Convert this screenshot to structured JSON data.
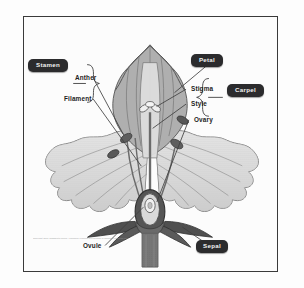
{
  "figure": {
    "credit": "Copyright 2001 Wadsworth Group / Thomson Learning is a division of Thomson Learning Inc."
  },
  "badges": [
    {
      "id": "stamen",
      "label": "Stamen"
    },
    {
      "id": "petal",
      "label": "Petal"
    },
    {
      "id": "carpel",
      "label": "Carpel"
    },
    {
      "id": "sepal",
      "label": "Sepal"
    }
  ],
  "leader_labels": [
    {
      "id": "anther",
      "label": "Anther"
    },
    {
      "id": "filament",
      "label": "Filament"
    },
    {
      "id": "stigma",
      "label": "Stigma"
    },
    {
      "id": "style",
      "label": "Style"
    },
    {
      "id": "ovary",
      "label": "Ovary"
    },
    {
      "id": "ovule",
      "label": "Ovule"
    }
  ],
  "colors": {
    "badge_background": "#2b2b2d",
    "badge_text": "#f2f2f2",
    "label_text": "#1d1d1d",
    "frame_border": "#3a3a3a",
    "page_background": "#ffffff",
    "petal_light": "#cfcfcf",
    "petal_mid": "#b3b3b3",
    "petal_shadow": "#9a9a9a",
    "sepal_dark": "#6e6e6e",
    "leader_line": "#4a4a4a"
  }
}
